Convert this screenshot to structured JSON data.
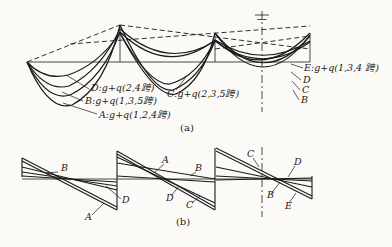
{
  "colors": {
    "ink": "#1a1a1a",
    "paper": "#fbfaf7"
  },
  "part_a": {
    "caption": "(a)",
    "label_d": "D:g+q(2,4跨)",
    "label_b": "B:g+q(1,3,5跨)",
    "label_a": "A:g+q(1,2,4跨)",
    "label_c": "C:g+q(2,3,5跨)",
    "label_e": "E:g+q(1,3,4 跨)",
    "tag_d": "D",
    "tag_c": "C",
    "tag_b": "B"
  },
  "part_b": {
    "caption": "(b)",
    "s1_b": "B",
    "s1_d": "D",
    "s1_a": "A",
    "s2_a": "A",
    "s2_b": "B",
    "s2_d": "D",
    "s2_c": "C",
    "s3_c": "C",
    "s3_d": "D",
    "s3_b": "B",
    "s3_e": "E"
  }
}
